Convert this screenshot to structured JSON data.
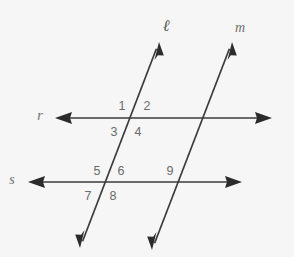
{
  "figure": {
    "background_color": "#f6f6f6",
    "stroke_color": "#3b3b3b",
    "label_color": "#6b6b6b",
    "width": 294,
    "height": 257
  },
  "lines": [
    {
      "id": "line-l",
      "label": "ℓ",
      "label_x": 166,
      "label_y": 27,
      "orientation": "transversal",
      "x1": 159,
      "y1": 42,
      "x2": 80,
      "y2": 248,
      "arrow_start": true,
      "arrow_end": true
    },
    {
      "id": "line-m",
      "label": "m",
      "label_x": 240,
      "label_y": 29,
      "orientation": "transversal",
      "x1": 232,
      "y1": 42,
      "x2": 152,
      "y2": 250,
      "arrow_start": true,
      "arrow_end": true
    },
    {
      "id": "line-r",
      "label": "r",
      "label_x": 40,
      "label_y": 117,
      "orientation": "horizontal",
      "x1": 55,
      "y1": 118,
      "x2": 272,
      "y2": 118,
      "arrow_start": true,
      "arrow_end": true
    },
    {
      "id": "line-s",
      "label": "s",
      "label_x": 12,
      "label_y": 181,
      "orientation": "horizontal",
      "x1": 28,
      "y1": 182,
      "x2": 242,
      "y2": 182,
      "arrow_start": true,
      "arrow_end": true
    }
  ],
  "angles": [
    {
      "id": "angle-1",
      "label": "1",
      "x": 122,
      "y": 107,
      "position": "upper-left",
      "vertex": "l-r"
    },
    {
      "id": "angle-2",
      "label": "2",
      "x": 147,
      "y": 107,
      "position": "upper-right",
      "vertex": "l-r"
    },
    {
      "id": "angle-3",
      "label": "3",
      "x": 114,
      "y": 133,
      "position": "lower-left",
      "vertex": "l-r"
    },
    {
      "id": "angle-4",
      "label": "4",
      "x": 138,
      "y": 133,
      "position": "lower-right",
      "vertex": "l-r"
    },
    {
      "id": "angle-5",
      "label": "5",
      "x": 97,
      "y": 172,
      "position": "upper-left",
      "vertex": "l-s"
    },
    {
      "id": "angle-6",
      "label": "6",
      "x": 121,
      "y": 172,
      "position": "upper-right",
      "vertex": "l-s"
    },
    {
      "id": "angle-7",
      "label": "7",
      "x": 88,
      "y": 197,
      "position": "lower-left",
      "vertex": "l-s"
    },
    {
      "id": "angle-8",
      "label": "8",
      "x": 113,
      "y": 197,
      "position": "lower-right",
      "vertex": "l-s"
    },
    {
      "id": "angle-9",
      "label": "9",
      "x": 170,
      "y": 172,
      "position": "upper-left",
      "vertex": "m-s"
    }
  ]
}
